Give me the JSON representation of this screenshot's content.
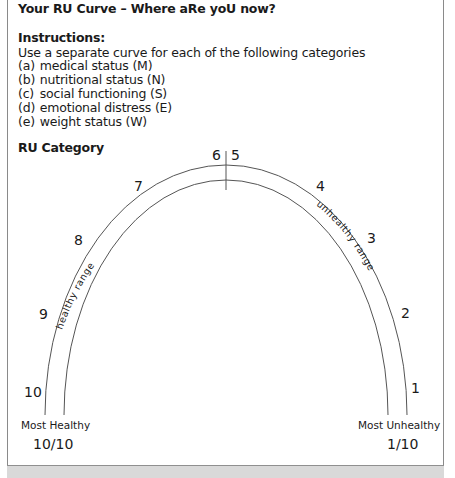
{
  "header": {
    "title": "Your RU Curve – Where aRe yoU now?"
  },
  "instructions": {
    "heading": "Instructions:",
    "text": "Use a separate curve for each of the following categories",
    "categories": [
      {
        "letter": "(a)",
        "label": "medical status (M)"
      },
      {
        "letter": "(b)",
        "label": "nutritional status (N)"
      },
      {
        "letter": "(c)",
        "label": "social functioning (S)"
      },
      {
        "letter": "(d)",
        "label": "emotional distress (E)"
      },
      {
        "letter": "(e)",
        "label": "weight status (W)"
      }
    ]
  },
  "diagram": {
    "section_label": "RU Category",
    "scale_numbers": [
      "10",
      "9",
      "8",
      "7",
      "6",
      "5",
      "4",
      "3",
      "2",
      "1"
    ],
    "left_range_label": "healthy range",
    "right_range_label": "unhealthy range",
    "left_end": {
      "label": "Most Healthy",
      "score": "10/10"
    },
    "right_end": {
      "label": "Most Unhealthy",
      "score": "1/10"
    },
    "colors": {
      "line": "#555555",
      "band": "#d9d9d9",
      "border": "#8a8a8a"
    }
  }
}
